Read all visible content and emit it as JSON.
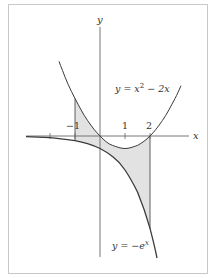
{
  "figure": {
    "axes": {
      "x_label": "x",
      "y_label": "y",
      "ticks": [
        {
          "value": -2,
          "label": ""
        },
        {
          "value": -1,
          "label": "−1"
        },
        {
          "value": 1,
          "label": "1"
        },
        {
          "value": 2,
          "label": "2"
        }
      ]
    },
    "curves": [
      {
        "name": "parabola",
        "label": "y = x² − 2x",
        "label_prefix": "y = x",
        "label_sup": "2",
        "label_suffix": " − 2x"
      },
      {
        "name": "exponential",
        "label": "y = −eˣ",
        "label_prefix": "y = −e",
        "label_sup": "x"
      }
    ],
    "shaded_region": {
      "from_x": -1,
      "to_x": 2,
      "between": [
        "y = x² − 2x",
        "y = −eˣ"
      ]
    },
    "colors": {
      "frame": "#c8c8c8",
      "axis": "#666666",
      "curve": "#3a3a3a",
      "shade": "#e2e2e2",
      "text": "#333333"
    }
  }
}
